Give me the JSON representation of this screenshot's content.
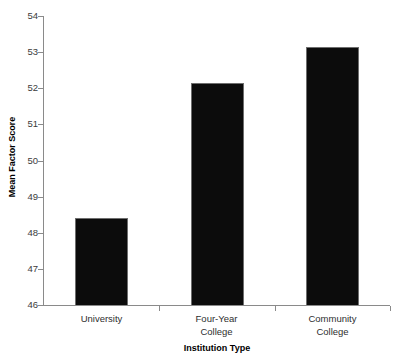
{
  "chart_data": {
    "type": "bar",
    "title": "",
    "subtitle": "",
    "xlabel": "Institution Type",
    "ylabel": "Mean Factor Score",
    "categories": [
      "University",
      "Four-Year College",
      "Community College"
    ],
    "category_lines": [
      [
        "University"
      ],
      [
        "Four-Year",
        "College"
      ],
      [
        "Community",
        "College"
      ]
    ],
    "values": [
      48.4,
      52.15,
      53.15
    ],
    "series": [
      {
        "name": "Mean Factor Score",
        "values": [
          48.4,
          52.15,
          53.15
        ],
        "color": "#0c0c0c"
      }
    ],
    "ylim": [
      46,
      54
    ],
    "xlim": [
      0,
      3
    ],
    "y_ticks": [
      46,
      47,
      48,
      49,
      50,
      51,
      52,
      53,
      54
    ],
    "y_tick_labels": [
      "46",
      "47",
      "48",
      "49",
      "50",
      "51",
      "52",
      "53",
      "54"
    ],
    "grid": false,
    "legend": null,
    "legend_position": "none",
    "bar_color": "#0c0c0c",
    "bar_edge_color": "#6e6e6e",
    "axis_color": "#8a8a8a",
    "background": "#ffffff",
    "orientation": "vertical",
    "annotations": []
  }
}
